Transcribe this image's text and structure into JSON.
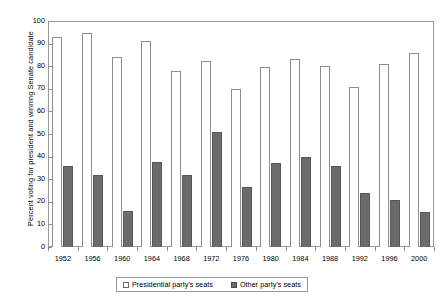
{
  "chart_data": {
    "type": "bar",
    "title": "",
    "xlabel": "",
    "ylabel": "Percent voting for president and winning Senate candidate",
    "ylim": [
      0,
      100
    ],
    "ytick_step": 10,
    "yticks": [
      0,
      10,
      20,
      30,
      40,
      50,
      60,
      70,
      80,
      90,
      100
    ],
    "grid": false,
    "legend_position": "bottom",
    "categories": [
      "1952",
      "1956",
      "1960",
      "1964",
      "1968",
      "1972",
      "1976",
      "1980",
      "1984",
      "1988",
      "1992",
      "1996",
      "2000"
    ],
    "series": [
      {
        "name": "Presidential party's seats",
        "color": "#ffffff",
        "values": [
          93,
          94.5,
          84,
          91,
          78,
          82.5,
          70,
          79.5,
          83,
          80,
          71,
          81,
          86
        ]
      },
      {
        "name": "Other party's seats",
        "color": "#6b6b6b",
        "values": [
          36,
          32,
          16,
          37.5,
          32,
          51,
          26.5,
          37,
          40,
          36,
          24,
          21,
          15.5
        ]
      }
    ]
  },
  "legend": {
    "entries": [
      {
        "label": "Presidential party's seats",
        "swatch": "white"
      },
      {
        "label": "Other party's seats",
        "swatch": "dark"
      }
    ]
  },
  "colors": {
    "presidential_party": "#ffffff",
    "other_party": "#6b6b6b",
    "axis": "#8e8e8e",
    "frame": "#9a9a9a",
    "text": "#000000",
    "background": "#ffffff"
  }
}
